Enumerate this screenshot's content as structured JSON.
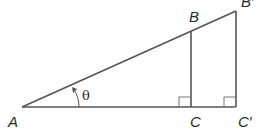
{
  "diagram": {
    "type": "similar right triangles",
    "labels": {
      "A": "A",
      "B": "B",
      "C": "C",
      "B_prime": "B′",
      "C_prime": "C′",
      "angle": "θ"
    },
    "colors": {
      "stroke": "#555555",
      "text": "#2a2a2a",
      "background": "#ffffff"
    }
  }
}
